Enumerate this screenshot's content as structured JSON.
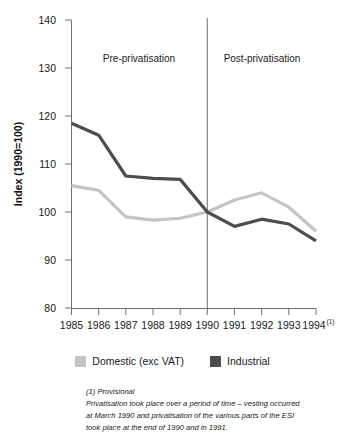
{
  "chart_data": {
    "type": "line",
    "title": "",
    "xlabel": "",
    "ylabel": "Index (1990=100)",
    "x": [
      "1985",
      "1986",
      "1987",
      "1988",
      "1989",
      "1990",
      "1991",
      "1992",
      "1993",
      "1994"
    ],
    "categories": [
      "1985",
      "1986",
      "1987",
      "1988",
      "1989",
      "1990",
      "1991",
      "1992",
      "1993",
      "1994"
    ],
    "ylim": [
      80,
      140
    ],
    "yticks": [
      80,
      90,
      100,
      110,
      120,
      130,
      140
    ],
    "ytick_labels": [
      "80",
      "90",
      "100",
      "110",
      "120",
      "130",
      "140"
    ],
    "xtick_labels": [
      "1985",
      "1986",
      "1987",
      "1988",
      "1989",
      "1990",
      "1991",
      "1992",
      "1993",
      "1994"
    ],
    "last_xtick_superscript": "(1)",
    "grid": false,
    "legend_position": "bottom-center",
    "series": [
      {
        "name": "Domestic (exc VAT)",
        "color": "#c4c4c4",
        "values": [
          105.5,
          104.5,
          99.0,
          98.3,
          98.7,
          100.0,
          102.5,
          104.0,
          101.0,
          96.0
        ]
      },
      {
        "name": "Industrial",
        "color": "#4d4d4d",
        "values": [
          118.5,
          116.0,
          107.5,
          107.0,
          106.8,
          100.0,
          97.0,
          98.5,
          97.5,
          94.0
        ]
      }
    ],
    "annotations": [
      {
        "name": "pre-privatisation-label",
        "text": "Pre-privatisation",
        "x": "1987.4",
        "y": 130
      },
      {
        "name": "post-privatisation-label",
        "text": "Post-privatisation",
        "x": "1992.1",
        "y": 130
      },
      {
        "name": "privatisation-divider",
        "text": "",
        "x": "1990",
        "y": 0
      }
    ]
  },
  "axis": {
    "y_title": "Index (1990=100)",
    "y_tick_labels": [
      "140",
      "130",
      "120",
      "110",
      "100",
      "90",
      "80"
    ],
    "x_tick_labels": [
      "1985",
      "1986",
      "1987",
      "1988",
      "1989",
      "1990",
      "1991",
      "1992",
      "1993",
      "1994"
    ],
    "x_last_superscript": "(1)"
  },
  "regions": {
    "pre_label": "Pre-privatisation",
    "post_label": "Post-privatisation"
  },
  "legend": {
    "items": [
      {
        "label": "Domestic (exc VAT)",
        "color": "#c4c4c4"
      },
      {
        "label": "Industrial",
        "color": "#4d4d4d"
      }
    ]
  },
  "footnote": {
    "line1": "(1) Provisional",
    "line2": "Privatisation took place over a period of time – vesting occurred",
    "line3": "at March 1990 and privatisation of the various parts of the ESI",
    "line4": "took place at the end of 1990 and in 1991."
  },
  "colors": {
    "domestic": "#c4c4c4",
    "industrial": "#4d4d4d",
    "axis": "#6e6e6e",
    "text": "#1a1a1a",
    "background": "#ffffff"
  }
}
